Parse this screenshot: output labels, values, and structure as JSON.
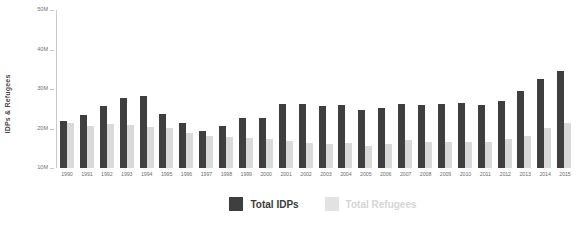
{
  "chart_data": {
    "type": "bar",
    "title": "",
    "xlabel": "",
    "ylabel": "IDPs & Refugees",
    "ylim": [
      10000000,
      50000000
    ],
    "ytick_labels": [
      "50M",
      "40M",
      "30M",
      "20M",
      "10M"
    ],
    "ytick_values": [
      50000000,
      40000000,
      30000000,
      20000000,
      10000000
    ],
    "grid": false,
    "legend_position": "bottom",
    "categories": [
      "1990",
      "1991",
      "1992",
      "1993",
      "1994",
      "1995",
      "1996",
      "1997",
      "1998",
      "1999",
      "2000",
      "2001",
      "2002",
      "2003",
      "2004",
      "2005",
      "2006",
      "2007",
      "2008",
      "2009",
      "2010",
      "2011",
      "2012",
      "2013",
      "2014",
      "2015"
    ],
    "series": [
      {
        "name": "Total IDPs",
        "color": "#3f3f3f",
        "values": [
          22000000,
          23500000,
          25800000,
          27800000,
          28200000,
          23800000,
          21400000,
          19300000,
          20700000,
          22600000,
          22700000,
          26100000,
          26100000,
          25700000,
          25900000,
          24600000,
          25200000,
          26100000,
          26000000,
          26300000,
          26500000,
          26000000,
          27000000,
          29500000,
          32500000,
          34500000
        ]
      },
      {
        "name": "Total Refugees",
        "color": "#d9d9d9",
        "values": [
          21300000,
          20700000,
          21200000,
          20800000,
          20400000,
          20100000,
          18900000,
          18200000,
          17800000,
          17700000,
          17400000,
          16800000,
          16300000,
          16000000,
          16300000,
          15700000,
          16000000,
          17000000,
          16500000,
          16500000,
          16700000,
          16600000,
          17300000,
          18000000,
          20200000,
          21500000
        ]
      }
    ]
  },
  "legend": {
    "items": [
      {
        "label": "Total IDPs",
        "color": "#3f3f3f"
      },
      {
        "label": "Total Refugees",
        "color": "#e2e2e2"
      }
    ]
  }
}
